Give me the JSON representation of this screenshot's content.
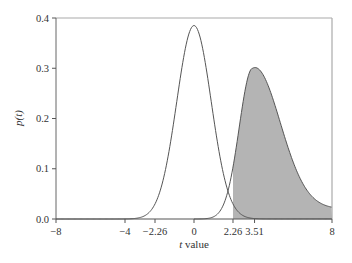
{
  "chart_data": {
    "type": "line",
    "title": "",
    "xlabel": "t value",
    "xlabel_italic_part": "t",
    "xlabel_rest": " value",
    "ylabel": "p(t)",
    "xlim": [
      -8,
      8
    ],
    "ylim": [
      0.0,
      0.4
    ],
    "grid": false,
    "legend": null,
    "x_ticks": [
      -8,
      -4,
      -2.26,
      0,
      2.26,
      3.51,
      8
    ],
    "x_tick_labels": [
      "−8",
      "−4",
      "−2.26",
      "0",
      "2.26",
      "3.51",
      "8"
    ],
    "y_ticks": [
      0.0,
      0.1,
      0.2,
      0.3,
      0.4
    ],
    "y_tick_labels": [
      "0.0",
      "0.1",
      "0.2",
      "0.3",
      "0.4"
    ],
    "series": [
      {
        "name": "central t distribution (null)",
        "style": "line",
        "color": "#555555",
        "peak_x": 0,
        "peak_y": 0.385,
        "x": [
          -8,
          -6,
          -4,
          -3,
          -2.26,
          -2,
          -1.5,
          -1,
          -0.5,
          0,
          0.5,
          1,
          1.5,
          2,
          2.26,
          3,
          4,
          6,
          8
        ],
        "y": [
          0.0,
          0.0,
          0.003,
          0.011,
          0.036,
          0.058,
          0.129,
          0.235,
          0.342,
          0.385,
          0.342,
          0.235,
          0.129,
          0.058,
          0.036,
          0.011,
          0.003,
          0.0,
          0.0
        ]
      },
      {
        "name": "noncentral t distribution (alternative)",
        "style": "line_with_shaded_tail",
        "color": "#555555",
        "fill_color": "#b4b4b4",
        "shade_from_x": 2.26,
        "shade_to_x": 8,
        "peak_x": 3.4,
        "peak_y": 0.3,
        "x": [
          0,
          0.5,
          1,
          1.5,
          2,
          2.26,
          2.5,
          3,
          3.4,
          3.51,
          4,
          4.5,
          5,
          5.5,
          6,
          6.5,
          7,
          7.5,
          8
        ],
        "y": [
          0.001,
          0.003,
          0.01,
          0.03,
          0.09,
          0.13,
          0.18,
          0.27,
          0.3,
          0.298,
          0.262,
          0.205,
          0.15,
          0.108,
          0.078,
          0.057,
          0.042,
          0.031,
          0.023
        ]
      }
    ],
    "annotations": [
      {
        "type": "tick",
        "x": -2.26,
        "label": "−2.26",
        "meaning": "lower critical value"
      },
      {
        "type": "tick",
        "x": 2.26,
        "label": "2.26",
        "meaning": "upper critical value; shaded region starts here"
      },
      {
        "type": "tick",
        "x": 3.51,
        "label": "3.51",
        "meaning": "observed t value"
      }
    ]
  },
  "labels": {
    "ylabel": "p(t)",
    "xlabel_t": "t",
    "xlabel_rest": " value"
  }
}
